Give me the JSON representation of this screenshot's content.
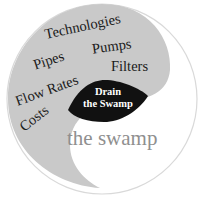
{
  "diagram": {
    "colors": {
      "outer_stroke": "#d9d9d9",
      "gray_region": "#c9c9c9",
      "white_region": "#ffffff",
      "center_fill": "#111111",
      "center_text": "#ffffff",
      "label_text": "#1a1a1a",
      "swamp_text": "#8f8f8f"
    },
    "gray_region": {
      "labels": [
        {
          "text": "Technologies"
        },
        {
          "text": "Pumps"
        },
        {
          "text": "Pipes"
        },
        {
          "text": "Filters"
        },
        {
          "text": "Flow Rates"
        },
        {
          "text": "Costs"
        }
      ]
    },
    "center": {
      "line1": "Drain",
      "line2": "the Swamp"
    },
    "white_region": {
      "label": "the swamp"
    }
  }
}
